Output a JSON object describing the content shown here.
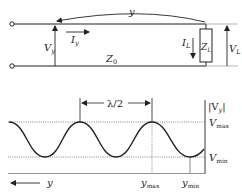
{
  "circuit": {
    "distance_label": "y",
    "voltage_at_y": {
      "main": "V",
      "sub": "y"
    },
    "current_at_y": {
      "main": "I",
      "sub": "y"
    },
    "characteristic_impedance": {
      "main": "Z",
      "sub": "0"
    },
    "load_current": {
      "main": "I",
      "sub": "L"
    },
    "load_impedance": {
      "main": "Z",
      "sub": "L"
    },
    "load_voltage": {
      "main": "V",
      "sub": "L"
    }
  },
  "plot": {
    "y_axis_label": {
      "main": "|V",
      "sub": "y",
      "close": "|"
    },
    "vmax_label": {
      "main": "V",
      "sub": "max"
    },
    "vmin_label": {
      "main": "V",
      "sub": "min"
    },
    "half_wavelength_label": "λ/2",
    "x_axis_label": "y",
    "ymax_label": {
      "main": "y",
      "sub": "max"
    },
    "ymin_label": {
      "main": "y",
      "sub": "min"
    }
  },
  "colors": {
    "line": "#222222",
    "dotted": "#555555"
  }
}
